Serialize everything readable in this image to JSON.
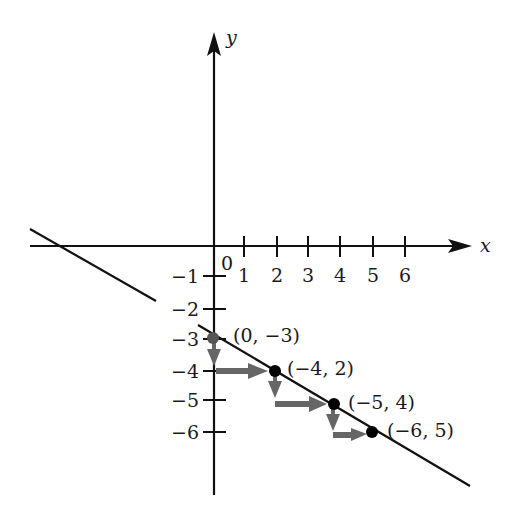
{
  "diagram": {
    "axes": {
      "x_label": "x",
      "y_label": "y",
      "origin_label": "0",
      "x_ticks": [
        "1",
        "2",
        "3",
        "4",
        "5",
        "6"
      ],
      "y_ticks": [
        "−1",
        "−2",
        "−3",
        "−4",
        "−5",
        "−6"
      ]
    },
    "points": [
      {
        "label": "(0, −3)",
        "x": 0,
        "y": -3
      },
      {
        "label": "(−4, 2)",
        "x": 2,
        "y": -4
      },
      {
        "label": "(−5, 4)",
        "x": 4,
        "y": -5
      },
      {
        "label": "(−6, 5)",
        "x": 5,
        "y": -6
      }
    ],
    "colors": {
      "ink": "#111111",
      "arrow": "#666666"
    }
  }
}
